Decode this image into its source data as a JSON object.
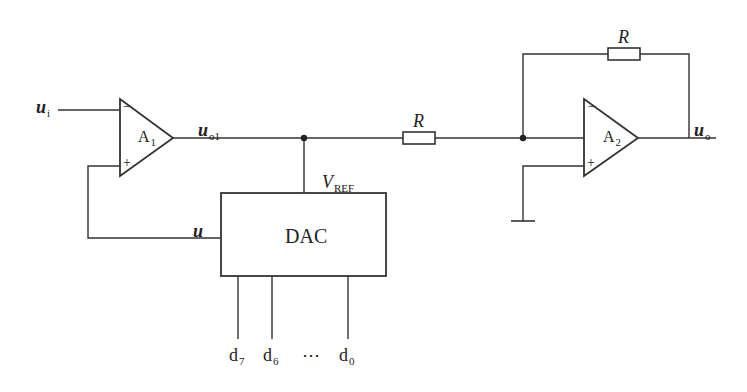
{
  "diagram": {
    "type": "circuit-schematic",
    "colors": {
      "line": "#333333",
      "background": "#ffffff",
      "text": "#222222"
    },
    "amplifiers": [
      {
        "id": "A1",
        "label": "A",
        "sub": "1",
        "minus": "−",
        "plus": "+"
      },
      {
        "id": "A2",
        "label": "A",
        "sub": "2",
        "minus": "−",
        "plus": "+"
      }
    ],
    "signals": {
      "ui": {
        "main": "u",
        "sub": "i"
      },
      "uo1": {
        "main": "u",
        "sub": "o1"
      },
      "uo": {
        "main": "u",
        "sub": "o"
      },
      "u": {
        "main": "u"
      },
      "vref": {
        "main": "V",
        "sub": "REF"
      }
    },
    "resistors": [
      {
        "id": "R_series",
        "label": "R"
      },
      {
        "id": "R_feedback",
        "label": "R"
      }
    ],
    "dac": {
      "label": "DAC"
    },
    "data_bits": [
      {
        "main": "d",
        "sub": "7"
      },
      {
        "main": "d",
        "sub": "6"
      },
      {
        "main": "⋯"
      },
      {
        "main": "d",
        "sub": "0"
      }
    ],
    "ground": {
      "label": "ground"
    }
  }
}
